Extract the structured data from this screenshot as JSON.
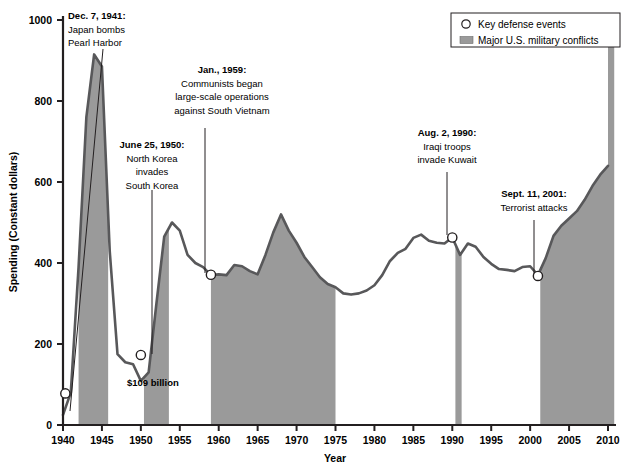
{
  "chart_data": {
    "type": "area",
    "title": "",
    "xlabel": "Year",
    "ylabel": "Spending (Constant dollars)",
    "xlim": [
      1940,
      2011
    ],
    "ylim": [
      0,
      1000
    ],
    "xticks": [
      1940,
      1945,
      1950,
      1955,
      1960,
      1965,
      1970,
      1975,
      1980,
      1985,
      1990,
      1995,
      2000,
      2005,
      2010
    ],
    "yticks": [
      0,
      200,
      400,
      600,
      800,
      1000
    ],
    "grid": false,
    "legend_position": "top-right",
    "series": [
      {
        "name": "Defense spending (constant dollars, billions)",
        "x": [
          1940,
          1941,
          1942,
          1943,
          1944,
          1945,
          1946,
          1947,
          1948,
          1949,
          1950,
          1951,
          1952,
          1953,
          1954,
          1955,
          1956,
          1957,
          1958,
          1959,
          1960,
          1961,
          1962,
          1963,
          1964,
          1965,
          1966,
          1967,
          1968,
          1969,
          1970,
          1971,
          1972,
          1973,
          1974,
          1975,
          1976,
          1977,
          1978,
          1979,
          1980,
          1981,
          1982,
          1983,
          1984,
          1985,
          1986,
          1987,
          1988,
          1989,
          1990,
          1991,
          1992,
          1993,
          1994,
          1995,
          1996,
          1997,
          1998,
          1999,
          2000,
          2001,
          2002,
          2003,
          2004,
          2005,
          2006,
          2007,
          2008,
          2009,
          2010
        ],
        "values": [
          25,
          80,
          390,
          760,
          915,
          885,
          430,
          175,
          155,
          150,
          109,
          130,
          300,
          465,
          500,
          480,
          420,
          400,
          390,
          370,
          372,
          370,
          395,
          392,
          380,
          372,
          420,
          475,
          520,
          480,
          450,
          415,
          390,
          365,
          348,
          340,
          325,
          322,
          325,
          332,
          345,
          370,
          405,
          425,
          435,
          462,
          470,
          455,
          450,
          448,
          463,
          420,
          448,
          440,
          415,
          398,
          385,
          383,
          380,
          390,
          392,
          370,
          412,
          467,
          492,
          510,
          528,
          556,
          590,
          618,
          640
        ]
      }
    ],
    "event_markers": [
      {
        "x": 1940.3,
        "y": 78,
        "label": "Dec. 7, 1941: Japan bombs Pearl Harbor"
      },
      {
        "x": 1950.0,
        "y": 173,
        "label": "June 25, 1950: North Korea invades South Korea"
      },
      {
        "x": 1959.0,
        "y": 371,
        "label": "Jan., 1959: Communists began large-scale operations against South Vietnam"
      },
      {
        "x": 1990.0,
        "y": 463,
        "label": "Aug. 2, 1990: Iraqi troops invade Kuwait"
      },
      {
        "x": 2001.0,
        "y": 368,
        "label": "Sept. 11, 2001: Terrorist attacks"
      }
    ],
    "conflict_bands": [
      {
        "start": 1942.0,
        "end": 1945.8,
        "name": "World War II"
      },
      {
        "start": 1950.4,
        "end": 1953.6,
        "name": "Korean War"
      },
      {
        "start": 1959.0,
        "end": 1975.0,
        "name": "Vietnam War"
      },
      {
        "start": 1990.4,
        "end": 1991.2,
        "name": "Gulf War"
      },
      {
        "start": 2001.3,
        "end": 2010.8,
        "name": "War on Terror"
      }
    ],
    "annotations": [
      {
        "id": "pearl-harbor",
        "lines": [
          "Dec. 7, 1941:",
          "Japan bombs",
          "Pearl Harbor"
        ],
        "bold_lines": 1,
        "align": "left",
        "text_x": 68,
        "text_y": 19,
        "leader": {
          "x1": 103,
          "y1": 49,
          "x2": 70,
          "y2": 411
        }
      },
      {
        "id": "korea",
        "lines": [
          "June 25, 1950:",
          "North Korea",
          "invades",
          "South Korea"
        ],
        "bold_lines": 1,
        "align": "center",
        "text_x": 152,
        "text_y": 148,
        "leader": {
          "x1": 152,
          "y1": 190,
          "x2": 152,
          "y2": 354
        }
      },
      {
        "id": "vietnam",
        "lines": [
          "Jan., 1959:",
          "Communists began",
          "large-scale operations",
          "against South Vietnam"
        ],
        "bold_lines": 1,
        "align": "center",
        "text_x": 222,
        "text_y": 73,
        "leader": {
          "x1": 205,
          "y1": 128,
          "x2": 205,
          "y2": 273
        }
      },
      {
        "id": "kuwait",
        "lines": [
          "Aug. 2, 1990:",
          "Iraqi troops",
          "invade Kuwait"
        ],
        "bold_lines": 1,
        "align": "center",
        "text_x": 447,
        "text_y": 136,
        "leader": {
          "x1": 447,
          "y1": 172,
          "x2": 447,
          "y2": 235
        }
      },
      {
        "id": "sept11",
        "lines": [
          "Sept. 11, 2001:",
          "Terrorist attacks"
        ],
        "bold_lines": 1,
        "align": "center",
        "text_x": 534,
        "text_y": 197,
        "leader": {
          "x1": 534,
          "y1": 220,
          "x2": 534,
          "y2": 274
        }
      },
      {
        "id": "low-point",
        "lines": [
          "$109 billion"
        ],
        "bold_lines": 1,
        "align": "left",
        "text_x": 127,
        "text_y": 386,
        "leader": null
      }
    ],
    "colors": {
      "line": "#58585a",
      "band_fill": "#9a9a9a",
      "axis": "#231f20",
      "marker_fill": "#ffffff",
      "marker_stroke": "#231f20",
      "text": "#000000"
    }
  },
  "legend": {
    "items": [
      {
        "symbol": "circle",
        "label": "Key defense events"
      },
      {
        "symbol": "swatch",
        "label": "Major U.S. military conflicts"
      }
    ]
  },
  "axes": {
    "x_title": "Year",
    "y_title": "Spending (Constant dollars)",
    "x_tick_labels": [
      "1940",
      "1945",
      "1950",
      "1955",
      "1960",
      "1965",
      "1970",
      "1975",
      "1980",
      "1985",
      "1990",
      "1995",
      "2000",
      "2005",
      "2010"
    ],
    "y_tick_labels": [
      "0",
      "200",
      "400",
      "600",
      "800",
      "1000"
    ]
  }
}
